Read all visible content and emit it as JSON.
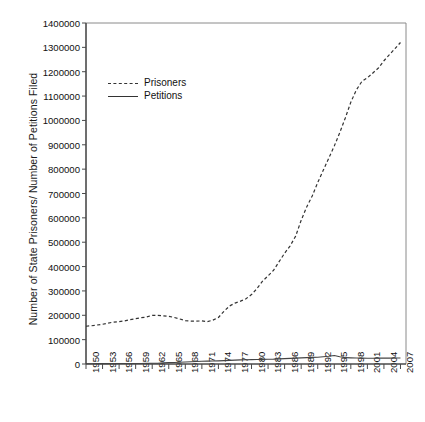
{
  "chart_data": {
    "type": "line",
    "title": "",
    "xlabel": "",
    "ylabel": "Number of State Prisoners/ Number of Petitions Filed",
    "ylim": [
      0,
      1400000
    ],
    "xlim": [
      1950,
      2008
    ],
    "grid": false,
    "legend_position": "upper-left-inside",
    "y_ticks": [
      "0",
      "100000",
      "200000",
      "300000",
      "400000",
      "500000",
      "600000",
      "700000",
      "800000",
      "900000",
      "1000000",
      "1100000",
      "1200000",
      "1300000",
      "1400000"
    ],
    "y_tick_values": [
      0,
      100000,
      200000,
      300000,
      400000,
      500000,
      600000,
      700000,
      800000,
      900000,
      1000000,
      1100000,
      1200000,
      1300000,
      1400000
    ],
    "x_tick_labels": [
      "1950",
      "1953",
      "1956",
      "1959",
      "1962",
      "1965",
      "1968",
      "1971",
      "1974",
      "1977",
      "1980",
      "1983",
      "1986",
      "1989",
      "1992",
      "1995",
      "1998",
      "2001",
      "2004",
      "2007"
    ],
    "x_tick_values": [
      1950,
      1953,
      1956,
      1959,
      1962,
      1965,
      1968,
      1971,
      1974,
      1977,
      1980,
      1983,
      1986,
      1989,
      1992,
      1995,
      1998,
      2001,
      2004,
      2007
    ],
    "x": [
      1950,
      1951,
      1952,
      1953,
      1954,
      1955,
      1956,
      1957,
      1958,
      1959,
      1960,
      1961,
      1962,
      1963,
      1964,
      1965,
      1966,
      1967,
      1968,
      1969,
      1970,
      1971,
      1972,
      1973,
      1974,
      1975,
      1976,
      1977,
      1978,
      1979,
      1980,
      1981,
      1982,
      1983,
      1984,
      1985,
      1986,
      1987,
      1988,
      1989,
      1990,
      1991,
      1992,
      1993,
      1994,
      1995,
      1996,
      1997,
      1998,
      1999,
      2000,
      2001,
      2002,
      2003,
      2004,
      2005,
      2006,
      2007
    ],
    "series": [
      {
        "name": "Prisoners",
        "style": "dashed",
        "color": "#333333",
        "values": [
          155000,
          157000,
          160000,
          163000,
          168000,
          172000,
          174000,
          177000,
          182000,
          186000,
          190000,
          193000,
          200000,
          200000,
          198000,
          196000,
          191000,
          185000,
          178000,
          176000,
          176000,
          177000,
          174000,
          180000,
          191000,
          216000,
          238000,
          250000,
          258000,
          268000,
          285000,
          310000,
          340000,
          362000,
          385000,
          420000,
          455000,
          485000,
          525000,
          590000,
          645000,
          690000,
          745000,
          795000,
          845000,
          895000,
          950000,
          1010000,
          1075000,
          1125000,
          1160000,
          1175000,
          1195000,
          1215000,
          1245000,
          1270000,
          1295000,
          1320000
        ]
      },
      {
        "name": "Petitions",
        "style": "solid",
        "color": "#444444",
        "values": [
          1200,
          1300,
          1400,
          1500,
          1600,
          1700,
          1800,
          1900,
          2000,
          2100,
          2300,
          2500,
          2800,
          3200,
          4500,
          5500,
          6200,
          7000,
          8000,
          9000,
          10000,
          11000,
          12000,
          12500,
          13000,
          14000,
          15000,
          16000,
          17000,
          17500,
          18000,
          18500,
          19000,
          19500,
          20000,
          21000,
          22000,
          23000,
          24000,
          25000,
          26000,
          27000,
          28000,
          30000,
          32000,
          35000,
          30000,
          26000,
          25000,
          24500,
          24000,
          23500,
          23500,
          24000,
          24000,
          24000,
          24500,
          24500
        ]
      }
    ]
  },
  "legend": {
    "entries": [
      {
        "label": "Prisoners",
        "style": "dashed"
      },
      {
        "label": "Petitions",
        "style": "solid"
      }
    ]
  },
  "caption": {
    "text": ""
  }
}
